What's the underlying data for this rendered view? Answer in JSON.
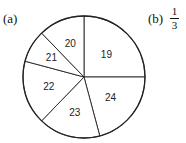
{
  "labels": {
    "part_a": "(a)",
    "part_b": "(b)"
  },
  "answer_b": {
    "numerator": "1",
    "denominator": "3"
  },
  "chart_data": {
    "type": "pie",
    "title": "",
    "categories": [
      "19",
      "24",
      "23",
      "22",
      "21",
      "20"
    ],
    "values": [
      90,
      75,
      59,
      61,
      31,
      44
    ],
    "unit": "degrees (approx. sector angles, clockwise from top)",
    "slice_labels": [
      "19",
      "24",
      "23",
      "22",
      "21",
      "20"
    ],
    "center": [
      84,
      77
    ],
    "radius": 61,
    "fill": "#ffffff",
    "stroke": "#222222"
  }
}
